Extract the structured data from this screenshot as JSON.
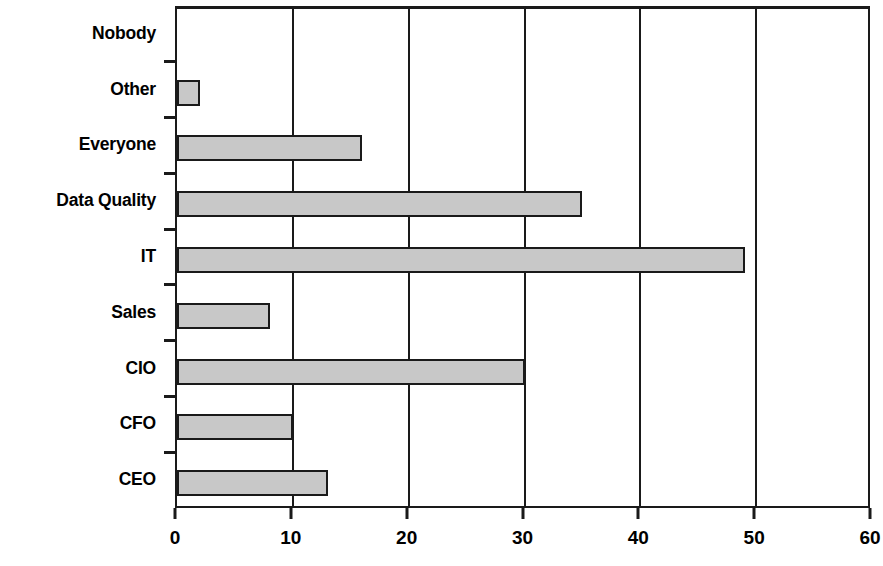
{
  "chart_data": {
    "type": "bar",
    "orientation": "horizontal",
    "title": "",
    "subtitle": "",
    "xlabel": "",
    "ylabel": "",
    "categories": [
      "Nobody",
      "Other",
      "Everyone",
      "Data Quality",
      "IT",
      "Sales",
      "CIO",
      "CFO",
      "CEO"
    ],
    "values": [
      0,
      2,
      16,
      35,
      49,
      8,
      30,
      10,
      13
    ],
    "xlim": [
      0,
      60
    ],
    "xticks": [
      0,
      10,
      20,
      30,
      40,
      50,
      60
    ],
    "xtick_labels": [
      "0",
      "10",
      "20",
      "30",
      "40",
      "50",
      "60"
    ],
    "grid": "vertical",
    "legend": "none",
    "bar_fill_color": "#c8c8c8",
    "bar_edge_color": "#1a1a1a",
    "axis_color": "#1a1a1a",
    "background_color": "#ffffff"
  }
}
